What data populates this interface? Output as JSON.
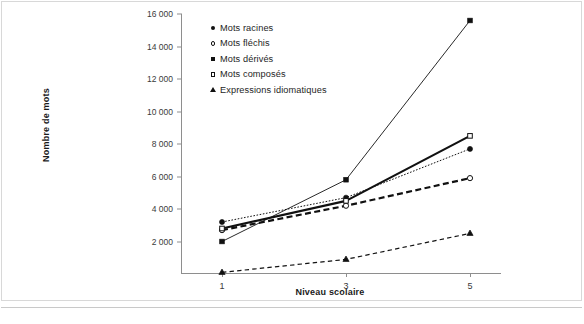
{
  "chart_data": {
    "type": "line",
    "title": "",
    "xlabel": "Niveau scolaire",
    "ylabel": "Nombre de mots",
    "categories": [
      "1",
      "3",
      "5"
    ],
    "ylim": [
      0,
      16000
    ],
    "yticks": [
      "2 000",
      "4 000",
      "6 000",
      "8 000",
      "10 000",
      "12 000",
      "14 000",
      "16 000"
    ],
    "ytick_values": [
      2000,
      4000,
      6000,
      8000,
      10000,
      12000,
      14000,
      16000
    ],
    "grid": false,
    "legend_position": "top-left inside plot",
    "series": [
      {
        "name": "Mots racines",
        "marker": "filled-circle",
        "line": "dotted",
        "values": [
          3200,
          4700,
          7700
        ]
      },
      {
        "name": "Mots fléchis",
        "marker": "open-circle",
        "line": "dashed-thick",
        "values": [
          2700,
          4200,
          5900
        ]
      },
      {
        "name": "Mots dérivés",
        "marker": "filled-square",
        "line": "solid-thin",
        "values": [
          2000,
          5800,
          15600
        ]
      },
      {
        "name": "Mots composés",
        "marker": "open-square",
        "line": "solid-thick",
        "values": [
          2800,
          4500,
          8500
        ]
      },
      {
        "name": "Expressions idiomatiques",
        "marker": "filled-triangle",
        "line": "dashed",
        "values": [
          100,
          900,
          2500
        ]
      }
    ]
  },
  "legend": {
    "items": [
      {
        "label": "Mots racines",
        "marker": "filled-circle-icon"
      },
      {
        "label": "Mots fléchis",
        "marker": "open-circle-icon"
      },
      {
        "label": "Mots dérivés",
        "marker": "filled-square-icon"
      },
      {
        "label": "Mots composés",
        "marker": "open-square-icon"
      },
      {
        "label": "Expressions idiomatiques",
        "marker": "filled-triangle-icon"
      }
    ]
  },
  "colors": {
    "line": "#111111",
    "axis": "#8e8e8e",
    "text": "#1e1e1e",
    "frame": "#d8d8d8"
  }
}
